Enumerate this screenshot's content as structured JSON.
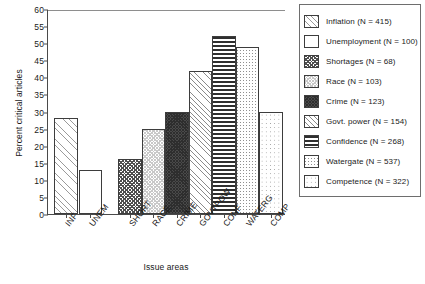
{
  "chart_data": {
    "type": "bar",
    "title": "",
    "xlabel": "Issue areas",
    "ylabel": "Percent critical articles",
    "ylim": [
      0,
      60
    ],
    "yticks": [
      0,
      5,
      10,
      15,
      20,
      25,
      30,
      35,
      40,
      45,
      50,
      55,
      60
    ],
    "grid": false,
    "legend_position": "right",
    "categories": [
      "INF",
      "UNEM",
      "SHORT",
      "RACE",
      "CRIME",
      "GOVTPOW",
      "CONF",
      "WATERG",
      "COMP"
    ],
    "values": [
      28,
      13,
      16,
      25,
      30,
      42,
      52,
      49,
      30
    ],
    "legend": [
      {
        "label": "Inflation (N = 415)",
        "pattern": "p-diag-light",
        "n": 415,
        "category": "INF"
      },
      {
        "label": "Unemployment (N = 100)",
        "pattern": "p-plain",
        "n": 100,
        "category": "UNEM"
      },
      {
        "label": "Shortages (N = 68)",
        "pattern": "p-check-dark",
        "n": 68,
        "category": "SHORT"
      },
      {
        "label": "Race (N = 103)",
        "pattern": "p-check-light",
        "n": 103,
        "category": "RACE"
      },
      {
        "label": "Crime (N = 123)",
        "pattern": "p-solid-dark",
        "n": 123,
        "category": "CRIME"
      },
      {
        "label": "Govt. power (N = 154)",
        "pattern": "p-diag-med",
        "n": 154,
        "category": "GOVTPOW"
      },
      {
        "label": "Confidence (N = 268)",
        "pattern": "p-hlines",
        "n": 268,
        "category": "CONF"
      },
      {
        "label": "Watergate (N = 537)",
        "pattern": "p-speck",
        "n": 537,
        "category": "WATERG"
      },
      {
        "label": "Competence (N = 322)",
        "pattern": "p-dots",
        "n": 322,
        "category": "COMP"
      }
    ]
  }
}
